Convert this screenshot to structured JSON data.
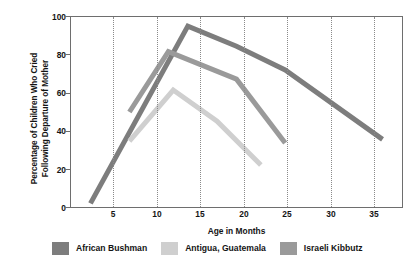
{
  "chart_data": {
    "type": "line",
    "title": "",
    "xlabel": "Age in Months",
    "ylabel": "Percentage of Children Who Cried\nFollowing Departure of Mother",
    "xlim": [
      3,
      37
    ],
    "ylim": [
      0,
      104
    ],
    "xticks": [
      5,
      10,
      15,
      20,
      25,
      30,
      35
    ],
    "yticks": [
      0,
      20,
      40,
      60,
      80,
      100
    ],
    "grid": "vertical-dotted",
    "legend_position": "bottom",
    "series": [
      {
        "name": "African Bushman",
        "color": "#7d7d7d",
        "x": [
          5,
          15,
          20,
          25,
          35
        ],
        "values": [
          2,
          99,
          88,
          75,
          37
        ]
      },
      {
        "name": "Antigua, Guatemala",
        "color": "#cfcfcf",
        "x": [
          9,
          13.5,
          18,
          22.5
        ],
        "values": [
          36,
          64,
          47,
          23
        ]
      },
      {
        "name": "Israeli Kibbutz",
        "color": "#9a9a9a",
        "x": [
          9,
          13,
          20,
          25
        ],
        "values": [
          52,
          85,
          70,
          35
        ]
      }
    ]
  },
  "axis": {
    "ytick_labels": [
      "100",
      "80",
      "60",
      "40",
      "20",
      "0"
    ],
    "xtick_labels": [
      "5",
      "10",
      "15",
      "20",
      "25",
      "30",
      "35"
    ],
    "x_axis_title": "Age in Months",
    "y_axis_title_line1": "Percentage of Children Who Cried",
    "y_axis_title_line2": "Following Departure of Mother"
  },
  "legend": {
    "items": [
      {
        "label": "African Bushman",
        "color": "#7d7d7d"
      },
      {
        "label": "Antigua, Guatemala",
        "color": "#cfcfcf"
      },
      {
        "label": "Israeli Kibbutz",
        "color": "#9a9a9a"
      }
    ]
  },
  "caption": ""
}
